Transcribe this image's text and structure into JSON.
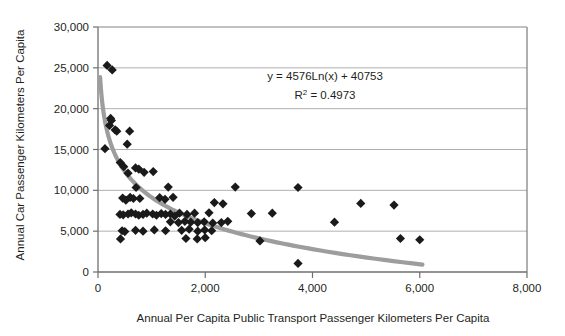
{
  "chart_data": {
    "type": "scatter",
    "title": "",
    "xlabel": "Annual Per Capita Public Transport Passenger Kilometers Per Capita",
    "ylabel": "Annual Car Passenger Kilometers Per Capita",
    "xlim": [
      0,
      8000
    ],
    "ylim": [
      0,
      30000
    ],
    "xticks": [
      "0",
      "2,000",
      "4,000",
      "6,000",
      "8,000"
    ],
    "xtick_values": [
      0,
      2000,
      4000,
      6000,
      8000
    ],
    "yticks": [
      "0",
      "5,000",
      "10,000",
      "15,000",
      "20,000",
      "25,000",
      "30,000"
    ],
    "ytick_values": [
      0,
      5000,
      10000,
      15000,
      20000,
      25000,
      30000
    ],
    "grid": "horizontal",
    "legend": "none",
    "marker": "diamond",
    "marker_color": "#1a1a1a",
    "trendline_color": "#9d9d9d",
    "gridline_color": "#a7a7a7",
    "annotations": {
      "equation": "y = 4576Ln(x) + 40753",
      "r_squared_label": "R",
      "r_squared_exponent": "2",
      "r_squared_value": "= 0.4973"
    },
    "trendline": {
      "type": "logarithmic",
      "equation": "y = -4576Ln(x) + 40753",
      "r_squared": 0.4973,
      "x_start": 40,
      "x_end": 6050
    },
    "points": [
      [
        170,
        25300
      ],
      [
        265,
        24750
      ],
      [
        130,
        15100
      ],
      [
        235,
        18800
      ],
      [
        250,
        18550
      ],
      [
        215,
        17950
      ],
      [
        320,
        17400
      ],
      [
        350,
        17250
      ],
      [
        590,
        17250
      ],
      [
        545,
        15650
      ],
      [
        415,
        13400
      ],
      [
        480,
        12900
      ],
      [
        560,
        12100
      ],
      [
        700,
        12750
      ],
      [
        760,
        12600
      ],
      [
        860,
        12200
      ],
      [
        1030,
        12300
      ],
      [
        710,
        10350
      ],
      [
        1310,
        10400
      ],
      [
        2560,
        10400
      ],
      [
        3730,
        10350
      ],
      [
        460,
        9050
      ],
      [
        520,
        8800
      ],
      [
        600,
        9150
      ],
      [
        660,
        9000
      ],
      [
        780,
        9000
      ],
      [
        1150,
        9100
      ],
      [
        1250,
        8900
      ],
      [
        1400,
        9150
      ],
      [
        2170,
        8500
      ],
      [
        2330,
        8350
      ],
      [
        4900,
        8400
      ],
      [
        5520,
        8200
      ],
      [
        410,
        7050
      ],
      [
        470,
        7000
      ],
      [
        560,
        7100
      ],
      [
        620,
        7250
      ],
      [
        700,
        7100
      ],
      [
        760,
        6950
      ],
      [
        840,
        7050
      ],
      [
        910,
        7200
      ],
      [
        1020,
        7100
      ],
      [
        1090,
        6950
      ],
      [
        1180,
        7150
      ],
      [
        1260,
        7050
      ],
      [
        1350,
        7100
      ],
      [
        1430,
        6850
      ],
      [
        1520,
        7200
      ],
      [
        1660,
        7050
      ],
      [
        1800,
        7200
      ],
      [
        2070,
        7250
      ],
      [
        2860,
        7150
      ],
      [
        3250,
        7200
      ],
      [
        1350,
        6150
      ],
      [
        1500,
        6050
      ],
      [
        1620,
        6200
      ],
      [
        1730,
        6100
      ],
      [
        1860,
        6050
      ],
      [
        1980,
        6150
      ],
      [
        2140,
        6000
      ],
      [
        2300,
        6050
      ],
      [
        2420,
        6200
      ],
      [
        4410,
        6100
      ],
      [
        450,
        5050
      ],
      [
        500,
        4950
      ],
      [
        700,
        5100
      ],
      [
        840,
        5000
      ],
      [
        1050,
        5150
      ],
      [
        1260,
        5050
      ],
      [
        1560,
        5100
      ],
      [
        1700,
        5250
      ],
      [
        1860,
        5000
      ],
      [
        1990,
        5150
      ],
      [
        2120,
        5050
      ],
      [
        420,
        4050
      ],
      [
        1640,
        4100
      ],
      [
        1850,
        4050
      ],
      [
        2000,
        4200
      ],
      [
        3020,
        3800
      ],
      [
        5640,
        4100
      ],
      [
        6000,
        3950
      ],
      [
        3730,
        1050
      ]
    ]
  }
}
